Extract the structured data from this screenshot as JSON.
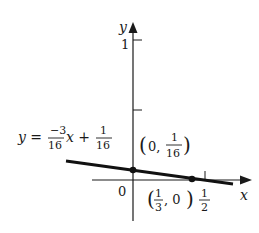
{
  "diagram": {
    "type": "line-graph",
    "axes": {
      "x_label": "x",
      "y_label": "y",
      "origin_label": "0",
      "y_tick_labels": [
        "1"
      ],
      "x_tick_labels": {
        "num": "1",
        "den": "2"
      }
    },
    "equation": {
      "lhs": "y =",
      "slope_num": "−3",
      "slope_den": "16",
      "var": "x +",
      "intercept_num": "1",
      "intercept_den": "16"
    },
    "points": [
      {
        "label_prefix": "(0,",
        "num": "1",
        "den": "16",
        "suffix": ")",
        "x": 0,
        "y": 0.0625
      },
      {
        "label_prefix": "(",
        "num": "1",
        "den": "3",
        "suffix": ", 0)",
        "x": 0.3333,
        "y": 0
      }
    ],
    "colors": {
      "ink": "#1a1a1a",
      "background": "#ffffff"
    }
  }
}
